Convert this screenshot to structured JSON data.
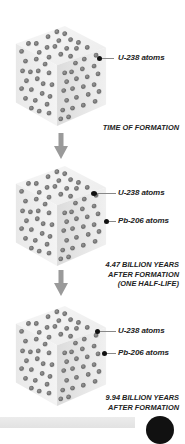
{
  "diagram": {
    "colors": {
      "atom_u238": "#7a7a7a",
      "atom_pb206": "#7a7a7a",
      "cube_top": "#f3f3f3",
      "cube_left": "#ececec",
      "cube_right": "#e4e4e4",
      "arrow": "#9a9a9a",
      "text": "#222222"
    },
    "stages": [
      {
        "caption_lines": [
          "TIME OF FORMATION"
        ],
        "labels": [
          "U-238 atoms"
        ]
      },
      {
        "caption_lines": [
          "4.47 BILLION YEARS",
          "AFTER FORMATION",
          "(ONE HALF-LIFE)"
        ],
        "labels": [
          "U-238 atoms",
          "Pb-206 atoms"
        ]
      },
      {
        "caption_lines": [
          "9.94 BILLION YEARS",
          "AFTER FORMATION"
        ],
        "labels": [
          "U-238 atoms",
          "Pb-206 atoms"
        ]
      }
    ]
  }
}
